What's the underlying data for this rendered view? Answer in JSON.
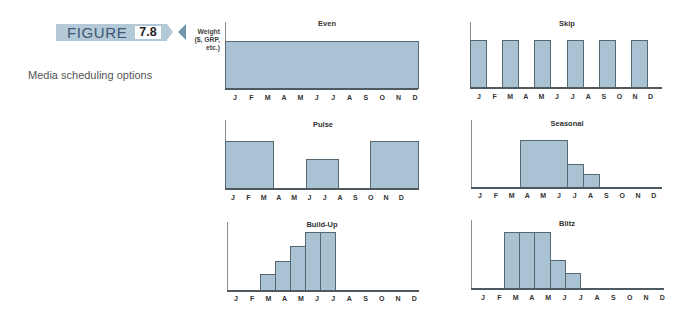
{
  "figure": {
    "label": "FIGURE",
    "number": "7.8",
    "caption": "Media scheduling options"
  },
  "y_axis_label": {
    "line1": "Weight",
    "line2": "($, GRP,",
    "line3": "etc.)"
  },
  "colors": {
    "banner": "#b3c9d7",
    "banner_text": "#3c5672",
    "pointer": "#6f97ad",
    "bar_fill": "#a9c3d4",
    "bar_stroke": "#56676f"
  },
  "chart_data": [
    {
      "type": "bar",
      "title": "Even",
      "categories": [
        "J",
        "F",
        "M",
        "A",
        "M",
        "J",
        "J",
        "A",
        "S",
        "O",
        "N",
        "D"
      ],
      "values": [
        100,
        100,
        100,
        100,
        100,
        100,
        100,
        100,
        100,
        100,
        100,
        100
      ],
      "xlabel": "",
      "ylabel": "Weight ($, GRP, etc.)",
      "ylim": [
        0,
        100
      ]
    },
    {
      "type": "bar",
      "title": "Skip",
      "categories": [
        "J",
        "F",
        "M",
        "A",
        "M",
        "J",
        "J",
        "A",
        "S",
        "O",
        "N",
        "D"
      ],
      "values": [
        100,
        0,
        100,
        0,
        100,
        0,
        100,
        0,
        100,
        0,
        100,
        0
      ],
      "xlabel": "",
      "ylabel": "",
      "ylim": [
        0,
        100
      ]
    },
    {
      "type": "bar",
      "title": "Pulse",
      "categories": [
        "J",
        "F",
        "M",
        "A",
        "M",
        "J",
        "J",
        "A",
        "S",
        "O",
        "N",
        "D"
      ],
      "values": [
        100,
        100,
        100,
        0,
        0,
        62,
        62,
        0,
        0,
        100,
        100,
        100
      ],
      "xlabel": "",
      "ylabel": "",
      "ylim": [
        0,
        100
      ]
    },
    {
      "type": "bar",
      "title": "Seasonal",
      "categories": [
        "J",
        "F",
        "M",
        "A",
        "M",
        "J",
        "J",
        "A",
        "S",
        "O",
        "N",
        "D"
      ],
      "values": [
        0,
        0,
        0,
        100,
        100,
        100,
        49,
        28,
        0,
        0,
        0,
        0
      ],
      "xlabel": "",
      "ylabel": "",
      "ylim": [
        0,
        100
      ]
    },
    {
      "type": "bar",
      "title": "Build-Up",
      "categories": [
        "J",
        "F",
        "M",
        "A",
        "M",
        "J",
        "J",
        "A",
        "S",
        "O",
        "N",
        "D"
      ],
      "values": [
        0,
        0,
        28,
        50,
        76,
        100,
        100,
        0,
        0,
        0,
        0,
        0
      ],
      "xlabel": "",
      "ylabel": "",
      "ylim": [
        0,
        100
      ]
    },
    {
      "type": "bar",
      "title": "Blitz",
      "categories": [
        "J",
        "F",
        "M",
        "A",
        "M",
        "J",
        "J",
        "A",
        "S",
        "O",
        "N",
        "D"
      ],
      "values": [
        0,
        0,
        100,
        100,
        100,
        50,
        27,
        0,
        0,
        0,
        0,
        0
      ],
      "xlabel": "",
      "ylabel": "",
      "ylim": [
        0,
        100
      ]
    }
  ]
}
